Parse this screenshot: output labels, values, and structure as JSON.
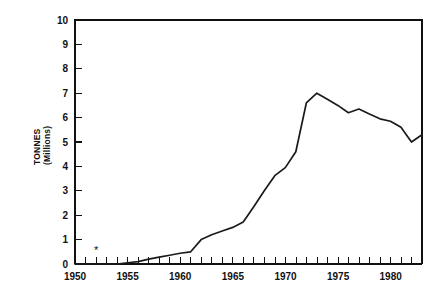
{
  "chart_data": {
    "type": "line",
    "title": "",
    "subtitle": "",
    "xlabel": "",
    "ylabel": "TONNES\n(Millions)",
    "ylabel_line1": "TONNES",
    "ylabel_line2": "(Millions)",
    "xlim": [
      1950,
      1983
    ],
    "ylim": [
      0,
      10
    ],
    "grid": false,
    "legend": null,
    "legend_position": "none",
    "x_tick_labels": [
      "1950",
      "1955",
      "1960",
      "1965",
      "1970",
      "1975",
      "1980"
    ],
    "x_major_ticks": [
      1950,
      1955,
      1960,
      1965,
      1970,
      1975,
      1980
    ],
    "x_minor_tick_step": 1,
    "y_tick_labels": [
      "0",
      "1",
      "2",
      "3",
      "4",
      "5",
      "6",
      "7",
      "8",
      "9",
      "10"
    ],
    "y_major_ticks": [
      0,
      1,
      2,
      3,
      4,
      5,
      6,
      7,
      8,
      9,
      10
    ],
    "x": [
      1950,
      1951,
      1952,
      1953,
      1954,
      1955,
      1956,
      1957,
      1958,
      1959,
      1960,
      1961,
      1962,
      1963,
      1964,
      1965,
      1966,
      1967,
      1968,
      1969,
      1970,
      1971,
      1972,
      1973,
      1974,
      1975,
      1976,
      1977,
      1978,
      1979,
      1980,
      1981,
      1982,
      1983
    ],
    "values": [
      0.0,
      0.0,
      0.0,
      0.0,
      0.0,
      0.05,
      0.1,
      0.2,
      0.28,
      0.36,
      0.44,
      0.5,
      1.0,
      1.2,
      1.35,
      1.5,
      1.72,
      2.35,
      3.0,
      3.62,
      3.95,
      4.6,
      6.6,
      7.0,
      6.75,
      6.5,
      6.2,
      6.35,
      6.15,
      5.95,
      5.85,
      5.6,
      5.0,
      5.3
    ],
    "series": [
      {
        "name": "Tonnes",
        "values": [
          0.0,
          0.0,
          0.0,
          0.0,
          0.0,
          0.05,
          0.1,
          0.2,
          0.28,
          0.36,
          0.44,
          0.5,
          1.0,
          1.2,
          1.35,
          1.5,
          1.72,
          2.35,
          3.0,
          3.62,
          3.95,
          4.6,
          6.6,
          7.0,
          6.75,
          6.5,
          6.2,
          6.35,
          6.15,
          5.95,
          5.85,
          5.6,
          5.0,
          5.3
        ]
      }
    ],
    "annotations": [
      {
        "name": "asterisk-marker",
        "symbol": "*",
        "x": 1952,
        "y": 0.55
      }
    ]
  },
  "plot": {
    "left_px": 75,
    "right_px": 422,
    "top_px": 20,
    "bottom_px": 264
  }
}
